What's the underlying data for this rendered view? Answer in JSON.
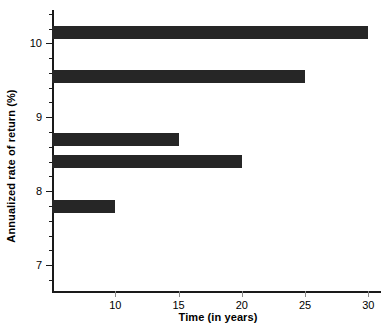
{
  "chart_data": {
    "type": "bar",
    "orientation": "horizontal",
    "title": "",
    "xlabel": "Time (in years)",
    "ylabel": "Annualized rate of return (%)",
    "xlim": [
      5,
      31
    ],
    "ylim": [
      6.65,
      10.45
    ],
    "grid": false,
    "legend": null,
    "xticks": [
      10,
      15,
      20,
      25,
      30
    ],
    "xtick_labels": [
      "10",
      "15",
      "20",
      "25",
      "30"
    ],
    "yticks": [
      7,
      8,
      9,
      10
    ],
    "ytick_labels": [
      "7",
      "8",
      "9",
      "10"
    ],
    "y_minor_tick_step": 0.2,
    "bar_color": "#262626",
    "axis_color": "#1a1a1a",
    "bars": [
      {
        "label": "30",
        "y_value": 10.15,
        "x_value": 30
      },
      {
        "label": "25",
        "y_value": 9.55,
        "x_value": 25
      },
      {
        "label": "15",
        "y_value": 8.7,
        "x_value": 15
      },
      {
        "label": "20",
        "y_value": 8.4,
        "x_value": 20
      },
      {
        "label": "10",
        "y_value": 7.8,
        "x_value": 10
      }
    ],
    "categories": [
      "10.15",
      "9.55",
      "8.70",
      "8.40",
      "7.80"
    ],
    "values": [
      30,
      25,
      15,
      20,
      10
    ]
  },
  "axes": {
    "x_title": "Time (in years)",
    "y_title": "Annualized rate of return (%)"
  }
}
